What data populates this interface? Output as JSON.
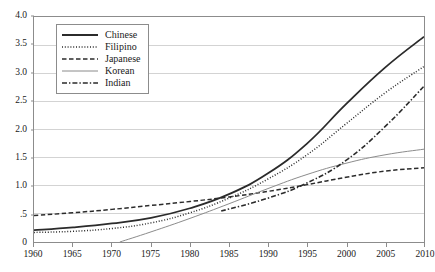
{
  "chart_data": {
    "type": "line",
    "title": "",
    "subtitle": "",
    "xlabel": "",
    "ylabel": "",
    "xlim": [
      1960,
      2010
    ],
    "ylim": [
      0,
      4.0
    ],
    "grid": "horizontal",
    "legend_position": "top-left-inside",
    "x_tick_labels": [
      "1960",
      "1965",
      "1970",
      "1975",
      "1980",
      "1985",
      "1990",
      "1995",
      "2000",
      "2005",
      "2010"
    ],
    "x_ticks": [
      1960,
      1965,
      1970,
      1975,
      1980,
      1985,
      1990,
      1995,
      2000,
      2005,
      2010
    ],
    "y_tick_labels": [
      "0",
      ".5",
      "1.0",
      "1.5",
      "2.0",
      "2.5",
      "3.0",
      "3.5",
      "4.0"
    ],
    "y_ticks": [
      0,
      0.5,
      1.0,
      1.5,
      2.0,
      2.5,
      3.0,
      3.5,
      4.0
    ],
    "series": [
      {
        "name": "Chinese",
        "style": "solid",
        "width": 1.8,
        "color": "#2b2b2b",
        "x": [
          1960,
          1965,
          1970,
          1975,
          1980,
          1985,
          1990,
          1995,
          2000,
          2005,
          2010
        ],
        "values": [
          0.21,
          0.26,
          0.33,
          0.43,
          0.6,
          0.85,
          1.22,
          1.75,
          2.45,
          3.1,
          3.65
        ]
      },
      {
        "name": "Filipino",
        "style": "dotted",
        "width": 1.5,
        "color": "#2b2b2b",
        "x": [
          1960,
          1965,
          1970,
          1975,
          1980,
          1985,
          1990,
          1995,
          2000,
          2005,
          2010
        ],
        "values": [
          0.17,
          0.19,
          0.24,
          0.34,
          0.52,
          0.78,
          1.12,
          1.55,
          2.1,
          2.65,
          3.12
        ]
      },
      {
        "name": "Japanese",
        "style": "dashed",
        "width": 1.5,
        "color": "#2b2b2b",
        "x": [
          1960,
          1965,
          1970,
          1975,
          1980,
          1985,
          1990,
          1995,
          2000,
          2005,
          2010
        ],
        "values": [
          0.47,
          0.52,
          0.58,
          0.65,
          0.72,
          0.8,
          0.9,
          1.02,
          1.15,
          1.26,
          1.32
        ]
      },
      {
        "name": "Korean",
        "style": "thin-solid",
        "width": 1.0,
        "color": "#8a8a8a",
        "x": [
          1971,
          1975,
          1980,
          1985,
          1990,
          1995,
          2000,
          2005,
          2010
        ],
        "values": [
          0.0,
          0.18,
          0.42,
          0.68,
          0.95,
          1.2,
          1.4,
          1.55,
          1.65
        ]
      },
      {
        "name": "Indian",
        "style": "dash-dot",
        "width": 1.6,
        "color": "#2b2b2b",
        "x": [
          1984,
          1990,
          1995,
          2000,
          2005,
          2010
        ],
        "values": [
          0.55,
          0.78,
          1.05,
          1.45,
          2.05,
          2.77
        ]
      }
    ]
  },
  "legend": {
    "entries": [
      {
        "label": "Chinese"
      },
      {
        "label": "Filipino"
      },
      {
        "label": "Japanese"
      },
      {
        "label": "Korean"
      },
      {
        "label": "Indian"
      }
    ]
  },
  "colors": {
    "axis": "#8c8c8c",
    "grid": "#d3d3d3",
    "text": "#1a1a1a",
    "series_dark": "#2b2b2b",
    "series_gray": "#8a8a8a",
    "background": "#ffffff"
  }
}
